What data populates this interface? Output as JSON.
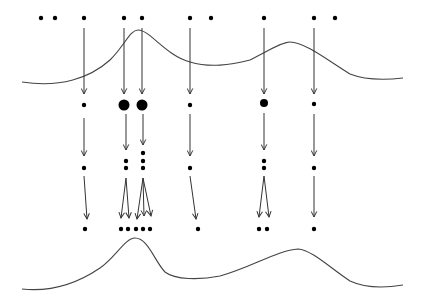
{
  "diagram": {
    "width": 423,
    "height": 306,
    "colors": {
      "ink": "#000000",
      "curve": "#444444",
      "arrow": "#333333",
      "background": "#ffffff"
    },
    "top_curve": "M22,82 C60,88 90,78 110,60 C125,45 130,30 138,30 C150,30 165,55 190,62 C210,68 230,65 250,60 C270,50 282,42 290,42 C305,42 330,62 350,74 C365,80 385,80 403,78",
    "bottom_curve": "M22,289 C50,292 75,285 100,268 C115,258 125,238 135,238 C148,238 155,262 165,272 C175,280 200,280 220,276 C250,268 278,250 298,249 C312,250 330,268 350,281 C365,288 385,288 403,285",
    "top_row": [
      {
        "x": 41,
        "y": 18,
        "r": 2.2
      },
      {
        "x": 55,
        "y": 18,
        "r": 2.2
      },
      {
        "x": 84,
        "y": 18,
        "r": 2.2
      },
      {
        "x": 124,
        "y": 18,
        "r": 2.2
      },
      {
        "x": 142,
        "y": 18,
        "r": 2.2
      },
      {
        "x": 190,
        "y": 18,
        "r": 2.2
      },
      {
        "x": 211,
        "y": 18,
        "r": 2.2
      },
      {
        "x": 264,
        "y": 18,
        "r": 2.2
      },
      {
        "x": 314,
        "y": 18,
        "r": 2.2
      },
      {
        "x": 335,
        "y": 18,
        "r": 2.2
      }
    ],
    "middle_row": [
      {
        "x": 84,
        "y": 105,
        "r": 2.2
      },
      {
        "x": 124,
        "y": 105,
        "r": 5.5
      },
      {
        "x": 142,
        "y": 105,
        "r": 5.5
      },
      {
        "x": 190,
        "y": 105,
        "r": 2.2
      },
      {
        "x": 264,
        "y": 103,
        "r": 4
      },
      {
        "x": 314,
        "y": 104,
        "r": 2.2
      }
    ],
    "stack_row": [
      {
        "x": 84,
        "y": 168,
        "r": 2.2
      },
      {
        "x": 126,
        "y": 161,
        "r": 2.2
      },
      {
        "x": 126,
        "y": 168,
        "r": 2.2
      },
      {
        "x": 143,
        "y": 153,
        "r": 2.2
      },
      {
        "x": 143,
        "y": 161,
        "r": 2.2
      },
      {
        "x": 143,
        "y": 168,
        "r": 2.2
      },
      {
        "x": 190,
        "y": 168,
        "r": 2.2
      },
      {
        "x": 264,
        "y": 161,
        "r": 2.2
      },
      {
        "x": 264,
        "y": 168,
        "r": 2.2
      },
      {
        "x": 314,
        "y": 168,
        "r": 2.2
      }
    ],
    "bottom_row": [
      {
        "x": 85,
        "y": 229,
        "r": 2.2
      },
      {
        "x": 121,
        "y": 229,
        "r": 2.2
      },
      {
        "x": 128,
        "y": 229,
        "r": 2.2
      },
      {
        "x": 136,
        "y": 229,
        "r": 2.2
      },
      {
        "x": 143,
        "y": 229,
        "r": 2.2
      },
      {
        "x": 150,
        "y": 229,
        "r": 2.2
      },
      {
        "x": 198,
        "y": 229,
        "r": 2.2
      },
      {
        "x": 259,
        "y": 229,
        "r": 2.2
      },
      {
        "x": 267,
        "y": 229,
        "r": 2.2
      },
      {
        "x": 314,
        "y": 229,
        "r": 2.2
      }
    ],
    "arrows_stage1": [
      {
        "x1": 84,
        "y1": 28,
        "x2": 84,
        "y2": 94
      },
      {
        "x1": 124,
        "y1": 28,
        "x2": 124,
        "y2": 94
      },
      {
        "x1": 142,
        "y1": 28,
        "x2": 142,
        "y2": 94
      },
      {
        "x1": 190,
        "y1": 28,
        "x2": 190,
        "y2": 94
      },
      {
        "x1": 264,
        "y1": 28,
        "x2": 264,
        "y2": 94
      },
      {
        "x1": 314,
        "y1": 28,
        "x2": 314,
        "y2": 94
      }
    ],
    "arrows_stage2": [
      {
        "x1": 84,
        "y1": 118,
        "x2": 84,
        "y2": 156
      },
      {
        "x1": 126,
        "y1": 114,
        "x2": 126,
        "y2": 150
      },
      {
        "x1": 143,
        "y1": 114,
        "x2": 143,
        "y2": 145
      },
      {
        "x1": 190,
        "y1": 114,
        "x2": 190,
        "y2": 156
      },
      {
        "x1": 264,
        "y1": 113,
        "x2": 264,
        "y2": 150
      },
      {
        "x1": 314,
        "y1": 114,
        "x2": 314,
        "y2": 156
      }
    ],
    "arrows_stage3": [
      {
        "x1": 84,
        "y1": 176,
        "x2": 87,
        "y2": 219
      },
      {
        "x1": 126,
        "y1": 178,
        "x2": 121,
        "y2": 218
      },
      {
        "x1": 126,
        "y1": 178,
        "x2": 129,
        "y2": 218
      },
      {
        "x1": 143,
        "y1": 178,
        "x2": 137,
        "y2": 219
      },
      {
        "x1": 143,
        "y1": 178,
        "x2": 144,
        "y2": 216
      },
      {
        "x1": 143,
        "y1": 178,
        "x2": 151,
        "y2": 216
      },
      {
        "x1": 190,
        "y1": 176,
        "x2": 196,
        "y2": 219
      },
      {
        "x1": 264,
        "y1": 176,
        "x2": 259,
        "y2": 217
      },
      {
        "x1": 264,
        "y1": 176,
        "x2": 269,
        "y2": 217
      },
      {
        "x1": 314,
        "y1": 176,
        "x2": 314,
        "y2": 217
      }
    ]
  }
}
